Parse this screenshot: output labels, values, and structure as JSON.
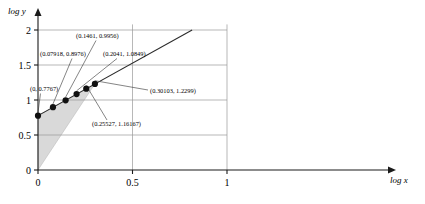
{
  "chart_data": {
    "type": "scatter",
    "title": "",
    "subtitle": "",
    "xlabel": "log x",
    "ylabel": "log y",
    "xlim": [
      0,
      1.06
    ],
    "ylim": [
      0,
      2.15
    ],
    "xticks": [
      "0",
      "0.5",
      "1"
    ],
    "xtick_values": [
      0,
      0.5,
      1
    ],
    "yticks": [
      "0",
      "0.5",
      "1",
      "1.5",
      "2"
    ],
    "ytick_values": [
      0,
      0.5,
      1,
      1.5,
      2
    ],
    "grid": true,
    "legend": "none",
    "x": [
      0,
      0.07918,
      0.1461,
      0.2041,
      0.25527,
      0.30103
    ],
    "y": [
      0.7767,
      0.8976,
      0.9956,
      1.0849,
      1.16167,
      1.2299
    ],
    "point_labels": [
      "(0, 0.7767)",
      "(0.07918, 0.8976)",
      "(0.1461, 0.9956)",
      "(0.2041, 1.0849)",
      "(0.25527, 1.16167)",
      "(0.30103, 1.2299)"
    ],
    "series": [
      {
        "name": "data-points",
        "values": [
          0.7767,
          0.8976,
          0.9956,
          1.0849,
          1.16167,
          1.2299
        ]
      }
    ],
    "trend_line": {
      "name": "fitted-line",
      "intercept": 0.7767,
      "slope": 1.5,
      "x_start": 0,
      "x_end": 0.8155,
      "y_start": 0.7767,
      "y_end": 2.0
    },
    "shaded_region": {
      "name": "slope-triangle",
      "fill": "#d9d9d9",
      "vertices": [
        [
          0,
          0
        ],
        [
          0,
          0.7767
        ],
        [
          0.30103,
          1.2299
        ]
      ]
    },
    "colors": {
      "axis": "#1a1a1a",
      "grid": "#9a9a9a",
      "point": "#101010",
      "line": "#2b2b2b",
      "shade": "#d9d9d9",
      "text": "#000000",
      "background": "#ffffff"
    }
  },
  "axes": {
    "x_name": "log x",
    "y_name": "log y"
  }
}
